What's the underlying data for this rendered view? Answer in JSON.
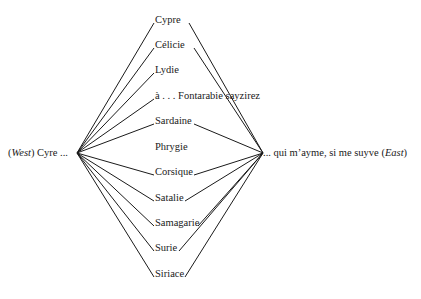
{
  "left_node": {
    "prefix": "(",
    "direction": "West",
    "suffix": ") Cyre ..."
  },
  "right_node": {
    "text": "... qui m’ayme, si me suyve (",
    "direction": "East",
    "suffix": ")"
  },
  "middle_nodes": [
    {
      "label": "Cypre",
      "top": 14,
      "left_link": true,
      "right_link": true,
      "lx": 155,
      "rx": 188
    },
    {
      "label": "Célicie",
      "top": 39,
      "left_link": true,
      "right_link": true,
      "lx": 155,
      "rx": 193
    },
    {
      "label": "Lydie",
      "top": 64,
      "left_link": true,
      "right_link": false,
      "lx": 155,
      "rx": 180
    },
    {
      "label": "à . . . Fontarabie sayzirez",
      "top": 90,
      "left_link": true,
      "right_link": false,
      "lx": 155,
      "rx": 256
    },
    {
      "label": "Sardaine",
      "top": 115,
      "left_link": true,
      "right_link": true,
      "lx": 155,
      "rx": 193
    },
    {
      "label": "Phrygie",
      "top": 141,
      "left_link": false,
      "right_link": false,
      "lx": 155,
      "rx": 190
    },
    {
      "label": "Corsique",
      "top": 166,
      "left_link": true,
      "right_link": true,
      "lx": 155,
      "rx": 193
    },
    {
      "label": "Satalie",
      "top": 192,
      "left_link": true,
      "right_link": true,
      "lx": 155,
      "rx": 184
    },
    {
      "label": "Samagarie",
      "top": 217,
      "left_link": true,
      "right_link": true,
      "lx": 155,
      "rx": 197
    },
    {
      "label": "Surie",
      "top": 242,
      "left_link": true,
      "right_link": true,
      "lx": 155,
      "rx": 178
    },
    {
      "label": "Siriace",
      "top": 268,
      "left_link": true,
      "right_link": true,
      "lx": 155,
      "rx": 184
    }
  ],
  "hubs": {
    "left": [
      77,
      153
    ],
    "right": [
      263,
      153
    ]
  },
  "colors": {
    "line": "#1a1a1a",
    "text": "#1a1a1a",
    "background": "#ffffff"
  }
}
